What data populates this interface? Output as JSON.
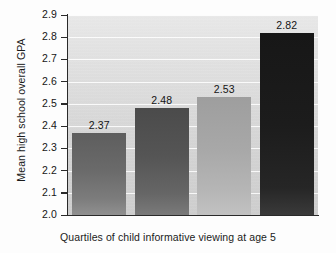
{
  "chart_data": {
    "type": "bar",
    "title": "",
    "xlabel": "Quartiles of child informative viewing at age 5",
    "ylabel": "Mean high school overall GPA",
    "categories": [
      "1",
      "2",
      "3",
      "4"
    ],
    "values": [
      2.37,
      2.48,
      2.53,
      2.82
    ],
    "value_labels": [
      "2.37",
      "2.48",
      "2.53",
      "2.82"
    ],
    "ylim": [
      2.0,
      2.9
    ],
    "ytick_labels": [
      "2.9",
      "2.8",
      "2.7",
      "2.6",
      "2.5",
      "2.4",
      "2.3",
      "2.2",
      "2.1",
      "2.0"
    ],
    "ytick_values": [
      2.9,
      2.8,
      2.7,
      2.6,
      2.5,
      2.4,
      2.3,
      2.2,
      2.1,
      2.0
    ],
    "xtick_labels": [
      "",
      "",
      "",
      ""
    ],
    "grid": true,
    "grid_axis": "y",
    "legend": false,
    "legend_position": "none",
    "bar_colors": [
      "#6a6a6a",
      "#555555",
      "#a8a8a8",
      "#1c1c1c"
    ],
    "plot_background": "#dedede",
    "figure_background": "#fdfdfd",
    "axis_color": "#2a2a2a",
    "gridline_color": "#ffffff"
  }
}
